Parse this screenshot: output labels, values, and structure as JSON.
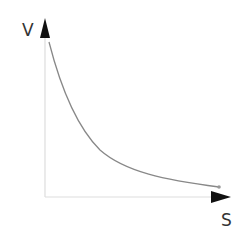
{
  "diagram": {
    "y_axis_label": "V",
    "x_axis_label": "S",
    "curve_description": "decreasing convex curve (inverse relationship)",
    "colors": {
      "axis": "#dddddd",
      "arrow": "#111111",
      "curve": "#888888",
      "label": "#333333"
    }
  }
}
